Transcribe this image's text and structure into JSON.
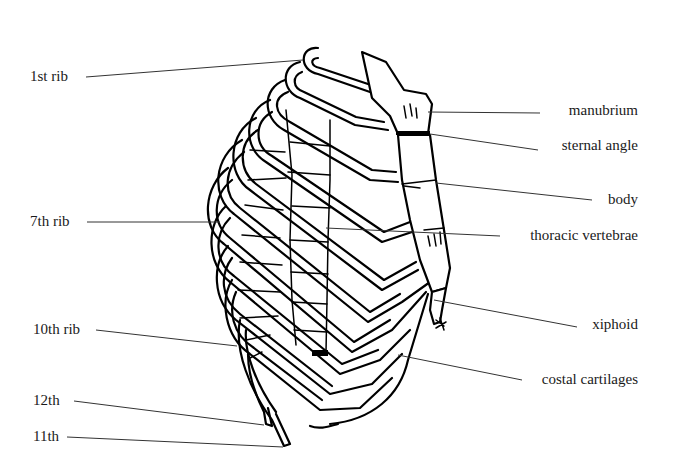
{
  "diagram": {
    "colors": {
      "background": "#ffffff",
      "ink": "#000000",
      "leader": "#333333"
    },
    "labels_left": [
      {
        "id": "1st-rib",
        "text": "1st rib",
        "x": 30,
        "y": 81,
        "line": [
          86,
          77,
          303,
          60
        ]
      },
      {
        "id": "7th-rib",
        "text": "7th rib",
        "x": 30,
        "y": 226,
        "line": [
          87,
          222,
          220,
          222
        ]
      },
      {
        "id": "10th-rib",
        "text": "10th rib",
        "x": 33,
        "y": 334,
        "line": [
          96,
          330,
          237,
          346
        ]
      },
      {
        "id": "12th-rib",
        "text": "12th",
        "x": 33,
        "y": 405,
        "line": [
          74,
          401,
          264,
          425
        ]
      },
      {
        "id": "11th-rib",
        "text": "11th",
        "x": 33,
        "y": 441,
        "line": [
          67,
          437,
          283,
          447
        ]
      }
    ],
    "labels_right": [
      {
        "id": "manubrium",
        "text": "manubrium",
        "x": 638,
        "y": 115,
        "line": [
          428,
          112,
          540,
          113
        ]
      },
      {
        "id": "sternal-angle",
        "text": "sternal angle",
        "x": 638,
        "y": 150,
        "line": [
          430,
          134,
          538,
          150
        ]
      },
      {
        "id": "body",
        "text": "body",
        "x": 638,
        "y": 204,
        "line": [
          436,
          183,
          592,
          200
        ]
      },
      {
        "id": "thoracic-vertebrae",
        "text": "thoracic vertebrae",
        "x": 638,
        "y": 240,
        "line": [
          326,
          228,
          500,
          236
        ]
      },
      {
        "id": "xiphoid",
        "text": "xiphoid",
        "x": 638,
        "y": 329,
        "line": [
          434,
          300,
          577,
          327
        ]
      },
      {
        "id": "costal-cartilages",
        "text": "costal cartilages",
        "x": 638,
        "y": 384,
        "line": [
          398,
          355,
          522,
          380
        ]
      }
    ]
  }
}
